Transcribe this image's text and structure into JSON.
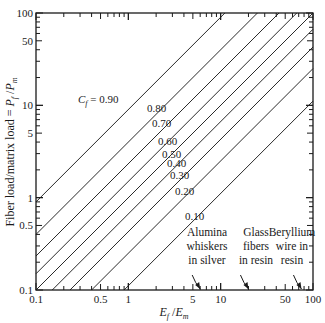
{
  "chart_data": {
    "type": "line",
    "title": "",
    "xlabel": "E_f/E_m",
    "ylabel": "Fiber load/matrix load = P_f/P_m",
    "xscale": "log",
    "yscale": "log",
    "xlim": [
      0.1,
      100
    ],
    "ylim": [
      0.1,
      100
    ],
    "grid": false,
    "x_tick_labels": [
      "0.1",
      "0.5",
      "1",
      "5",
      "10",
      "50",
      "100"
    ],
    "x_tick_values": [
      0.1,
      0.5,
      1,
      5,
      10,
      50,
      100
    ],
    "y_tick_labels": [
      "0.1",
      "0.5",
      "1",
      "5",
      "10",
      "50",
      "100"
    ],
    "y_tick_values": [
      0.1,
      0.5,
      1,
      5,
      10,
      50,
      100
    ],
    "relation": "P_f/P_m = (E_f/E_m) * C_f / (1 - C_f)",
    "series": [
      {
        "name": "C_f = 0.90",
        "cf": 0.9,
        "label": "C_f = 0.90"
      },
      {
        "name": "0.80",
        "cf": 0.8,
        "label": "0.80"
      },
      {
        "name": "0.70",
        "cf": 0.7,
        "label": "0.70"
      },
      {
        "name": "0.60",
        "cf": 0.6,
        "label": "0.60"
      },
      {
        "name": "0.50",
        "cf": 0.5,
        "label": "0.50"
      },
      {
        "name": "0.40",
        "cf": 0.4,
        "label": "0.40"
      },
      {
        "name": "0.30",
        "cf": 0.3,
        "label": "0.30"
      },
      {
        "name": "0.20",
        "cf": 0.2,
        "label": "0.20"
      },
      {
        "name": "0.10",
        "cf": 0.1,
        "label": "0.10"
      }
    ],
    "annotations": [
      {
        "lines": [
          "Alumina",
          "whiskers",
          "in silver"
        ],
        "x": 6
      },
      {
        "lines": [
          "Glass",
          "fibers",
          "in resin"
        ],
        "x": 20
      },
      {
        "lines": [
          "Beryllium",
          "wire in",
          "resin"
        ],
        "x": 75
      }
    ]
  }
}
